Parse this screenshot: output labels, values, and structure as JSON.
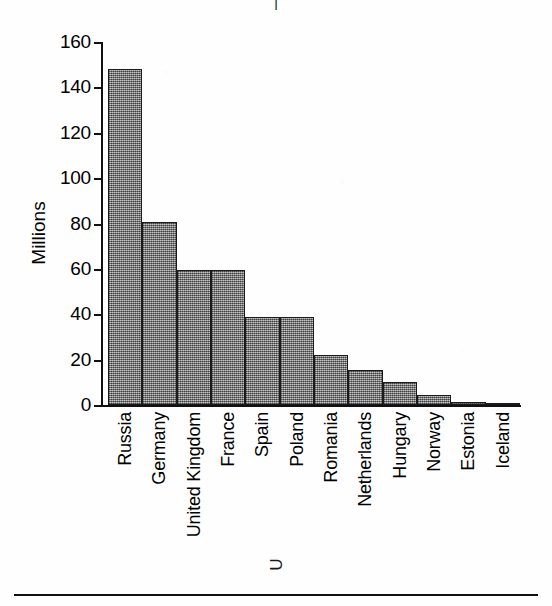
{
  "figure": {
    "title_fragment": "|",
    "bottom_rule": true,
    "descender_artifact": "U"
  },
  "chart_data": {
    "type": "bar",
    "title": "",
    "xlabel": "",
    "ylabel": "Millions",
    "ylim": [
      0,
      160
    ],
    "yticks": [
      0,
      20,
      40,
      60,
      80,
      100,
      120,
      140,
      160
    ],
    "ytick_labels": [
      "0",
      "20",
      "40",
      "60",
      "80",
      "100",
      "120",
      "140",
      "160"
    ],
    "grid": false,
    "legend": "none",
    "bar_color": "#8e8e8e",
    "bar_edge_color": "#1a1a1a",
    "categories": [
      "Russia",
      "Germany",
      "United Kingdom",
      "France",
      "Spain",
      "Poland",
      "Romania",
      "Netherlands",
      "Hungary",
      "Norway",
      "Estonia",
      "Iceland"
    ],
    "values": [
      148,
      80.5,
      59.5,
      59.5,
      39,
      39,
      22,
      15.5,
      10,
      4.5,
      1.3,
      0.3
    ]
  }
}
